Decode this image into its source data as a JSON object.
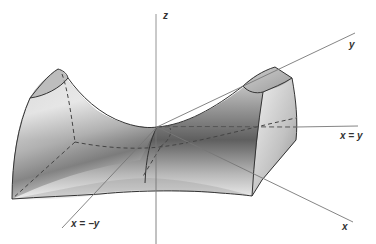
{
  "diagram": {
    "type": "saddle-surface",
    "labels": {
      "z_axis": "z",
      "y_axis": "y",
      "x_axis": "x",
      "line_x_eq_y": "x = y",
      "line_x_eq_neg_y": "x = −y"
    },
    "colors": {
      "axis": "#777777",
      "edge": "#333333",
      "dashed": "#444444",
      "surface_light": "#f2f2f2",
      "surface_dark": "#6e6e6e",
      "label": "#333333"
    }
  }
}
